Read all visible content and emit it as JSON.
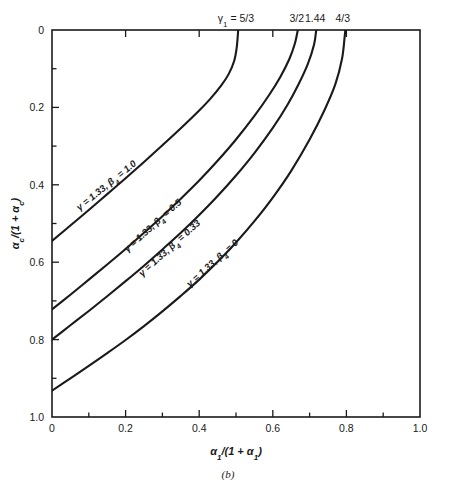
{
  "figure": {
    "panel_caption": "(b)",
    "background_color": "#ffffff",
    "line_color": "#1a1a1a"
  },
  "chart_data": {
    "type": "line",
    "title": "",
    "subtitle": "",
    "xlabel": "α₁/(1 + α₁)",
    "ylabel": "α_c/(1 + α_c)",
    "xlim": [
      0,
      1.0
    ],
    "ylim": [
      0,
      1.0
    ],
    "y_axis_inverted": true,
    "grid": false,
    "legend_position": "inline-curve-labels",
    "xticks": [
      0,
      0.2,
      0.4,
      0.6,
      0.8,
      1.0
    ],
    "xtick_labels": [
      "0",
      "0.2",
      "0.4",
      "0.6",
      "0.8",
      "1.0"
    ],
    "yticks": [
      0,
      0.2,
      0.4,
      0.6,
      0.8,
      1.0
    ],
    "ytick_labels": [
      "0",
      "0.2",
      "0.4",
      "0.6",
      "0.8",
      "1.0"
    ],
    "x_minor_ticks": [
      0.1,
      0.3,
      0.5,
      0.7,
      0.9
    ],
    "y_minor_ticks": [
      0.1,
      0.3,
      0.5,
      0.7,
      0.9
    ],
    "top_axis_annotations": [
      {
        "label": "γ₁ = 5/3",
        "x": 0.5
      },
      {
        "label": "3/2",
        "x": 0.665
      },
      {
        "label": "1.44",
        "x": 0.715
      },
      {
        "label": "4/3",
        "x": 0.79
      }
    ],
    "series": [
      {
        "name": "γ = 1.33, β₄ = 1.0",
        "label": "γ = 1.33, β₄ = 1.0",
        "gamma": 1.33,
        "beta_4": 1.0,
        "points": [
          [
            0.0,
            0.545
          ],
          [
            0.05,
            0.505
          ],
          [
            0.1,
            0.465
          ],
          [
            0.15,
            0.424
          ],
          [
            0.2,
            0.383
          ],
          [
            0.25,
            0.341
          ],
          [
            0.3,
            0.298
          ],
          [
            0.35,
            0.254
          ],
          [
            0.4,
            0.208
          ],
          [
            0.43,
            0.178
          ],
          [
            0.46,
            0.143
          ],
          [
            0.48,
            0.114
          ],
          [
            0.495,
            0.08
          ],
          [
            0.502,
            0.045
          ],
          [
            0.506,
            0.0
          ]
        ]
      },
      {
        "name": "γ = 1.33, β₄ = 0.5",
        "label": "γ = 1.33, β₄ = 0.5",
        "gamma": 1.33,
        "beta_4": 0.5,
        "points": [
          [
            0.0,
            0.722
          ],
          [
            0.05,
            0.684
          ],
          [
            0.1,
            0.645
          ],
          [
            0.15,
            0.606
          ],
          [
            0.2,
            0.566
          ],
          [
            0.25,
            0.524
          ],
          [
            0.3,
            0.481
          ],
          [
            0.35,
            0.436
          ],
          [
            0.4,
            0.389
          ],
          [
            0.45,
            0.338
          ],
          [
            0.5,
            0.283
          ],
          [
            0.55,
            0.222
          ],
          [
            0.59,
            0.168
          ],
          [
            0.62,
            0.122
          ],
          [
            0.645,
            0.075
          ],
          [
            0.66,
            0.035
          ],
          [
            0.668,
            0.0
          ]
        ]
      },
      {
        "name": "γ = 1.33, β₄ = 0.33",
        "label": "γ = 1.33, β₄ = 0.33",
        "gamma": 1.33,
        "beta_4": 0.33,
        "points": [
          [
            0.0,
            0.8
          ],
          [
            0.05,
            0.763
          ],
          [
            0.1,
            0.726
          ],
          [
            0.15,
            0.688
          ],
          [
            0.2,
            0.649
          ],
          [
            0.25,
            0.609
          ],
          [
            0.3,
            0.567
          ],
          [
            0.35,
            0.524
          ],
          [
            0.4,
            0.478
          ],
          [
            0.45,
            0.429
          ],
          [
            0.5,
            0.376
          ],
          [
            0.55,
            0.318
          ],
          [
            0.6,
            0.253
          ],
          [
            0.64,
            0.193
          ],
          [
            0.67,
            0.14
          ],
          [
            0.695,
            0.088
          ],
          [
            0.712,
            0.038
          ],
          [
            0.718,
            0.0
          ]
        ]
      },
      {
        "name": "γ = 1.33, β₄ = 0",
        "label": "γ = 1.33, β₄ = 0",
        "gamma": 1.33,
        "beta_4": 0,
        "points": [
          [
            0.0,
            0.932
          ],
          [
            0.05,
            0.9
          ],
          [
            0.1,
            0.868
          ],
          [
            0.15,
            0.835
          ],
          [
            0.2,
            0.801
          ],
          [
            0.25,
            0.765
          ],
          [
            0.3,
            0.727
          ],
          [
            0.35,
            0.687
          ],
          [
            0.4,
            0.645
          ],
          [
            0.45,
            0.599
          ],
          [
            0.5,
            0.549
          ],
          [
            0.55,
            0.494
          ],
          [
            0.6,
            0.433
          ],
          [
            0.65,
            0.364
          ],
          [
            0.7,
            0.283
          ],
          [
            0.74,
            0.208
          ],
          [
            0.77,
            0.14
          ],
          [
            0.788,
            0.075
          ],
          [
            0.795,
            0.02
          ],
          [
            0.797,
            0.0
          ]
        ]
      }
    ],
    "curve_label_positions": [
      {
        "series": 0,
        "x": 0.075,
        "y": 0.468,
        "rotation": -39
      },
      {
        "series": 1,
        "x": 0.205,
        "y": 0.575,
        "rotation": -42
      },
      {
        "series": 2,
        "x": 0.245,
        "y": 0.638,
        "rotation": -42
      },
      {
        "series": 3,
        "x": 0.375,
        "y": 0.665,
        "rotation": -42
      }
    ]
  }
}
